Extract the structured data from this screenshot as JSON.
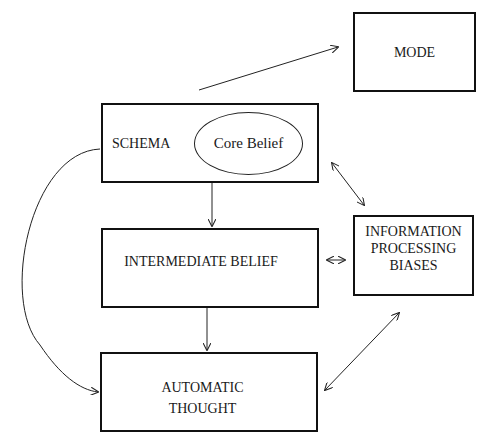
{
  "diagram": {
    "nodes": {
      "mode": {
        "label": "MODE"
      },
      "schema": {
        "label": "SCHEMA"
      },
      "core_belief": {
        "label": "Core Belief"
      },
      "intermediate_belief": {
        "label": "INTERMEDIATE BELIEF"
      },
      "automatic_thought": {
        "line1": "AUTOMATIC",
        "line2": "THOUGHT"
      },
      "information_processing_biases": {
        "line1": "INFORMATION",
        "line2": "PROCESSING",
        "line3": "BIASES"
      }
    },
    "edges": [
      {
        "from": "schema",
        "to": "mode",
        "type": "arrow"
      },
      {
        "from": "schema",
        "to": "intermediate_belief",
        "type": "arrow"
      },
      {
        "from": "intermediate_belief",
        "to": "automatic_thought",
        "type": "arrow"
      },
      {
        "from": "schema",
        "to": "automatic_thought",
        "type": "curved-arrow"
      },
      {
        "from": "schema",
        "to": "information_processing_biases",
        "type": "bidirectional"
      },
      {
        "from": "intermediate_belief",
        "to": "information_processing_biases",
        "type": "bidirectional"
      },
      {
        "from": "automatic_thought",
        "to": "information_processing_biases",
        "type": "bidirectional"
      }
    ],
    "colors": {
      "stroke": "#111111",
      "background": "#ffffff"
    }
  }
}
